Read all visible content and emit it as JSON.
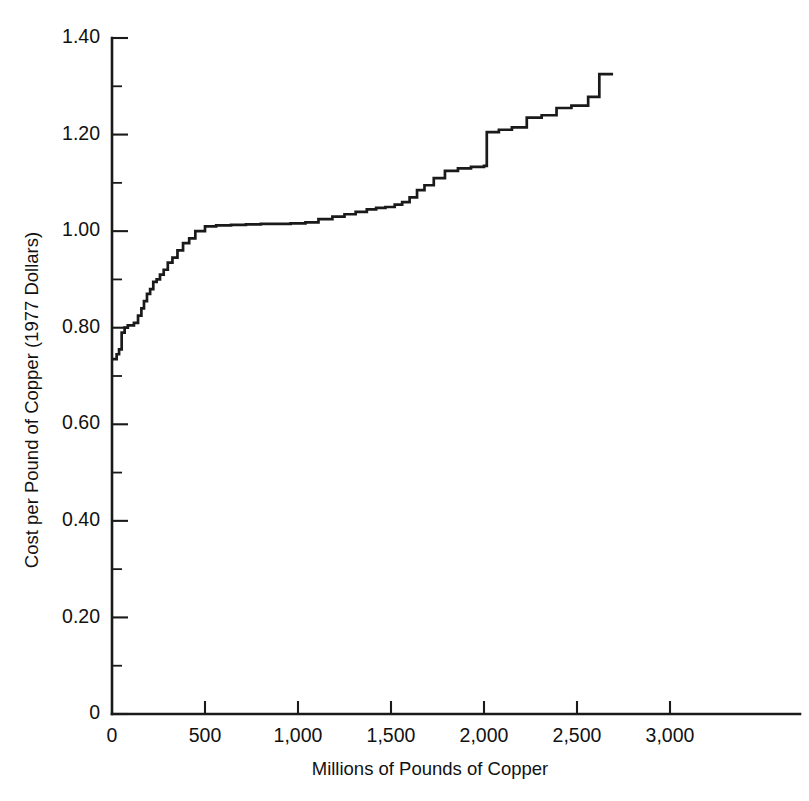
{
  "chart_data": {
    "type": "line",
    "subtype": "step-supply-curve",
    "title": "",
    "xlabel": "Millions of Pounds of Copper",
    "ylabel": "Cost per Pound of Copper (1977 Dollars)",
    "xlim": [
      0,
      3600
    ],
    "ylim": [
      0,
      1.4
    ],
    "grid": false,
    "legend": null,
    "xticks": [
      0,
      500,
      1000,
      1500,
      2000,
      2500,
      3000
    ],
    "xtick_labels": [
      "0",
      "500",
      "1,000",
      "1,500",
      "2,000",
      "2,500",
      "3,000"
    ],
    "x_minor_tick_step": 250,
    "yticks": [
      0,
      0.2,
      0.4,
      0.6,
      0.8,
      1.0,
      1.2,
      1.4
    ],
    "ytick_labels": [
      "0",
      "0.20",
      "0.40",
      "0.60",
      "0.80",
      "1.00",
      "1.20",
      "1.40"
    ],
    "y_minor_tick_step": 0.1,
    "line_color": "#1a1a1a",
    "series": [
      {
        "name": "Copper supply curve",
        "step_type": "post",
        "x": [
          0,
          12,
          25,
          38,
          52,
          68,
          85,
          100,
          118,
          140,
          158,
          172,
          188,
          205,
          222,
          240,
          258,
          278,
          300,
          325,
          352,
          382,
          415,
          448,
          500,
          560,
          640,
          720,
          800,
          880,
          960,
          1040,
          1110,
          1185,
          1250,
          1310,
          1370,
          1420,
          1470,
          1520,
          1560,
          1600,
          1640,
          1680,
          1730,
          1790,
          1860,
          1930,
          2000,
          2015,
          2080,
          2150,
          2230,
          2310,
          2390,
          2470,
          2560,
          2620,
          2694
        ],
        "y": [
          0.735,
          0.735,
          0.745,
          0.755,
          0.79,
          0.8,
          0.805,
          0.805,
          0.81,
          0.825,
          0.84,
          0.855,
          0.87,
          0.88,
          0.895,
          0.9,
          0.91,
          0.92,
          0.935,
          0.945,
          0.96,
          0.975,
          0.985,
          1.0,
          1.01,
          1.012,
          1.013,
          1.014,
          1.015,
          1.015,
          1.016,
          1.018,
          1.025,
          1.03,
          1.035,
          1.04,
          1.045,
          1.048,
          1.05,
          1.055,
          1.06,
          1.07,
          1.085,
          1.095,
          1.11,
          1.125,
          1.13,
          1.133,
          1.135,
          1.205,
          1.21,
          1.215,
          1.235,
          1.24,
          1.255,
          1.26,
          1.278,
          1.325,
          1.325
        ]
      }
    ]
  },
  "axes": {
    "y_axis_title": "Cost per Pound of Copper (1977 Dollars)",
    "x_axis_title": "Millions of Pounds of Copper"
  }
}
